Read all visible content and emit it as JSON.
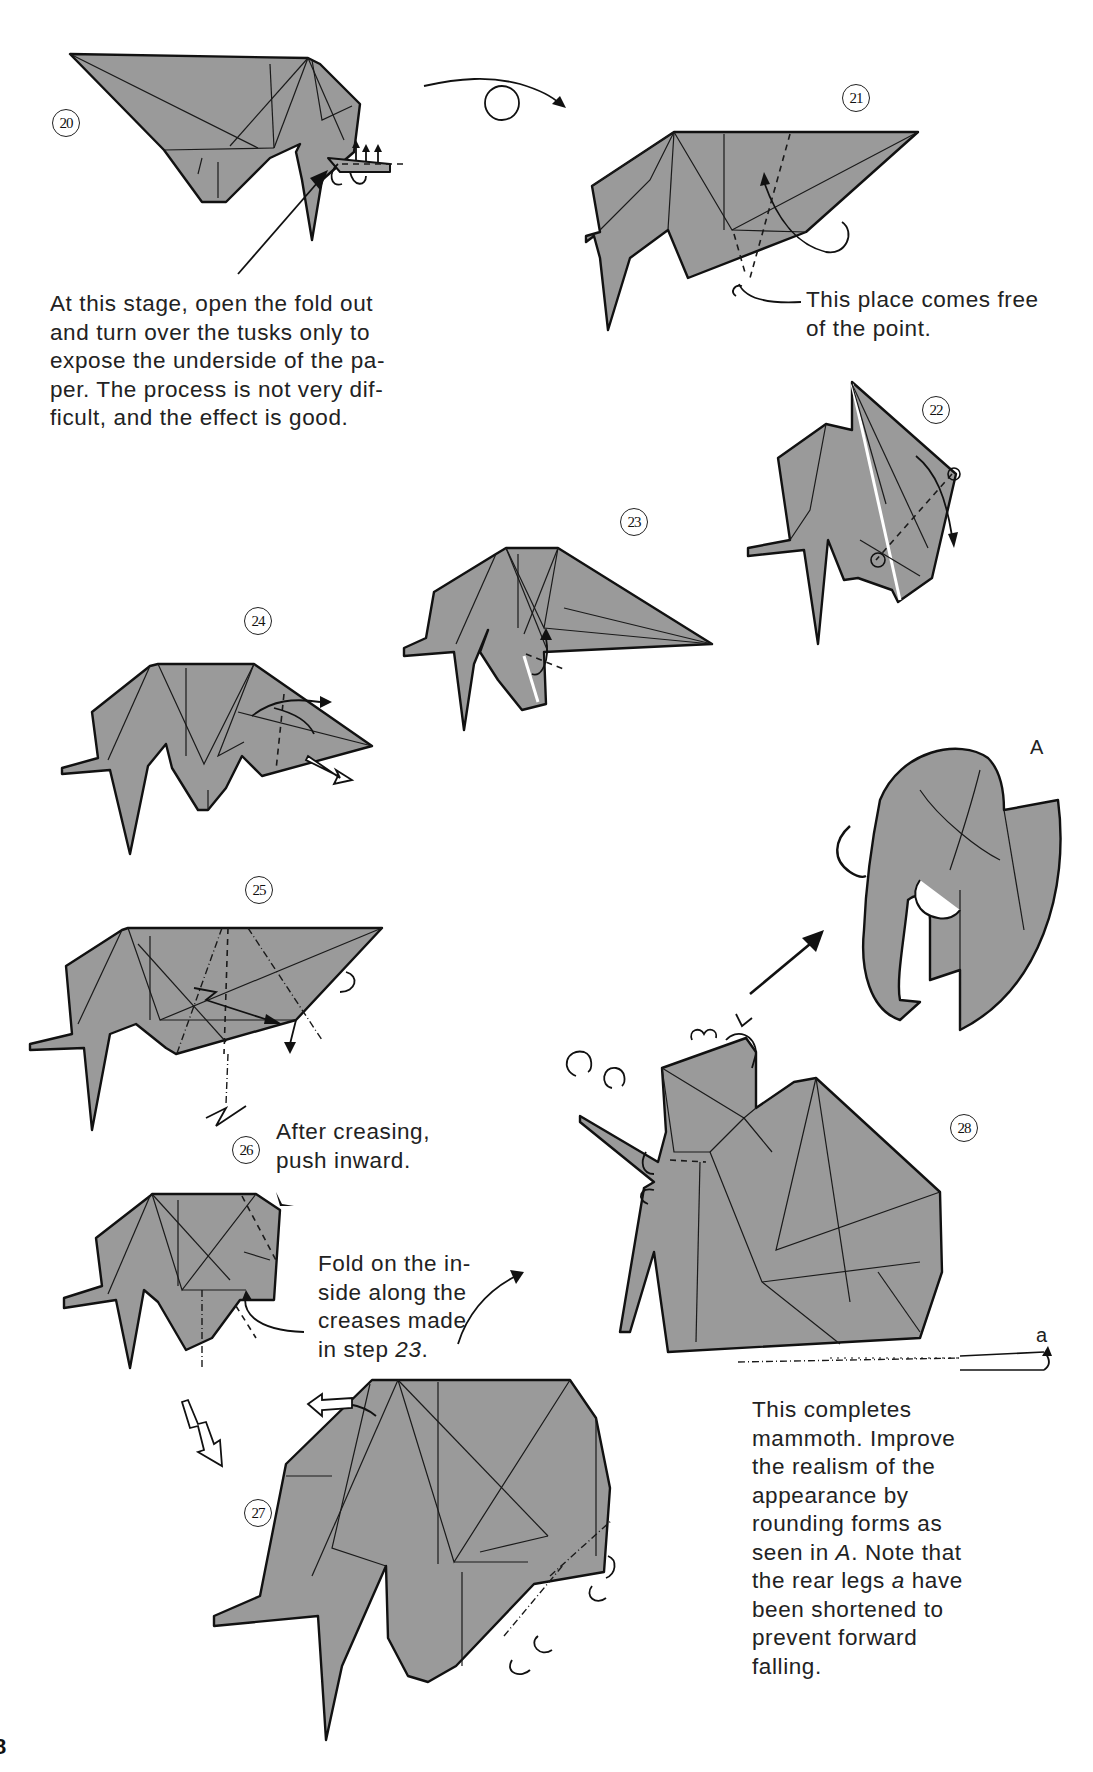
{
  "page": {
    "page_number_fragment": "8",
    "paper_color": "#9a9a9a",
    "line_color": "#111111",
    "background": "#ffffff"
  },
  "steps": [
    {
      "id": "20",
      "label": "⑳"
    },
    {
      "id": "21",
      "label": "㉑"
    },
    {
      "id": "22",
      "label": "㉒"
    },
    {
      "id": "23",
      "label": "㉓"
    },
    {
      "id": "24",
      "label": "㉔"
    },
    {
      "id": "25",
      "label": "㉕"
    },
    {
      "id": "26",
      "label": "㉖"
    },
    {
      "id": "27",
      "label": "㉗"
    },
    {
      "id": "28",
      "label": "㉘"
    }
  ],
  "captions": {
    "step20": "At this stage, open the fold out and turn over the tusks only to expose the underside of the paper. The process is not very difficult, and the effect is good.",
    "step20_lines": [
      "At this stage, open the fold out",
      "and turn over the tusks only to",
      "expose the underside of the pa-",
      "per. The process is not very dif-",
      "ficult, and the effect is good."
    ],
    "step21_lines": [
      "This place comes free",
      "of the point."
    ],
    "step26_push_lines": [
      "After creasing,",
      "push inward."
    ],
    "step26_fold_lines": [
      "Fold on the in-",
      "side along the",
      "creases made"
    ],
    "step26_fold_last_prefix": "in step ",
    "step26_fold_last_ref": "23",
    "step26_fold_last_suffix": ".",
    "final_lines_1": [
      "This completes",
      "mammoth. Improve",
      "the realism of the",
      "appearance by",
      "rounding forms as"
    ],
    "final_line_6_prefix": "seen in ",
    "final_line_6_ref": "A",
    "final_line_6_suffix": ". Note that",
    "final_line_7_prefix": "the rear legs ",
    "final_line_7_ref": "a",
    "final_line_7_suffix": " have",
    "final_lines_2": [
      "been shortened to",
      "prevent forward",
      "falling."
    ]
  },
  "labels": {
    "detail_view": "A",
    "rear_legs": "a"
  },
  "symbols": {
    "turn_over": "turn-over-symbol",
    "push_in": "push-in-arrow",
    "enlarge": "enlarge-arrow"
  }
}
